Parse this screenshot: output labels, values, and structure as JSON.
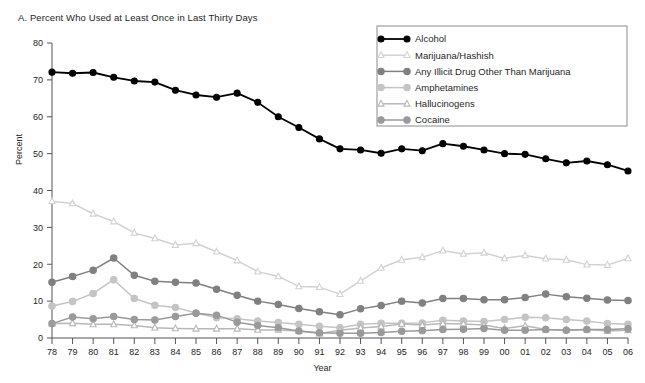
{
  "panel": {
    "title": "A. Percent Who Used at Least Once in Last Thirty Days"
  },
  "axes": {
    "ylabel": "Percent",
    "xlabel": "Year",
    "ytick_labels": [
      "0",
      "10",
      "20",
      "30",
      "40",
      "50",
      "60",
      "70",
      "80"
    ],
    "xtick_labels": [
      "78",
      "79",
      "80",
      "81",
      "82",
      "83",
      "84",
      "85",
      "86",
      "87",
      "88",
      "89",
      "90",
      "91",
      "92",
      "93",
      "94",
      "95",
      "96",
      "97",
      "98",
      "99",
      "00",
      "01",
      "02",
      "03",
      "04",
      "05",
      "06"
    ]
  },
  "legend": {
    "entries": [
      {
        "label": "Alcohol",
        "color": "#000000",
        "marker": "circle",
        "filled": true
      },
      {
        "label": "Marijuana/Hashish",
        "color": "#d2d2d2",
        "marker": "triangle",
        "filled": false
      },
      {
        "label": "Any Illicit Drug Other Than Marijuana",
        "color": "#808080",
        "marker": "circle",
        "filled": true
      },
      {
        "label": "Amphetamines",
        "color": "#c4c4c4",
        "marker": "circle",
        "filled": true
      },
      {
        "label": "Hallucinogens",
        "color": "#b8b8b8",
        "marker": "triangle",
        "filled": false
      },
      {
        "label": "Cocaine",
        "color": "#9a9a9a",
        "marker": "circle",
        "filled": true
      }
    ]
  },
  "chart_data": {
    "type": "line",
    "title": "A. Percent Who Used at Least Once in Last Thirty Days",
    "xlabel": "Year",
    "ylabel": "Percent",
    "xlim": [
      0,
      28
    ],
    "ylim": [
      0,
      80
    ],
    "ytick_step": 10,
    "grid": false,
    "legend_position": "top-right",
    "categories": [
      "78",
      "79",
      "80",
      "81",
      "82",
      "83",
      "84",
      "85",
      "86",
      "87",
      "88",
      "89",
      "90",
      "91",
      "92",
      "93",
      "94",
      "95",
      "96",
      "97",
      "98",
      "99",
      "00",
      "01",
      "02",
      "03",
      "04",
      "05",
      "06"
    ],
    "series": [
      {
        "name": "Alcohol",
        "color": "#000000",
        "marker": "circle",
        "filled": true,
        "values": [
          72.1,
          71.8,
          72.0,
          70.7,
          69.7,
          69.4,
          67.2,
          65.9,
          65.3,
          66.4,
          63.9,
          60.0,
          57.1,
          54.0,
          51.3,
          51.0,
          50.1,
          51.3,
          50.8,
          52.7,
          52.0,
          51.0,
          50.0,
          49.8,
          48.6,
          47.5,
          48.0,
          47.0,
          45.3
        ],
        "values_approx": true
      },
      {
        "name": "Marijuana/Hashish",
        "color": "#d2d2d2",
        "marker": "triangle",
        "filled": false,
        "values": [
          37.1,
          36.5,
          33.7,
          31.6,
          28.5,
          27.0,
          25.2,
          25.7,
          23.4,
          21.0,
          18.0,
          16.7,
          14.0,
          13.8,
          11.9,
          15.5,
          19.0,
          21.2,
          21.9,
          23.7,
          22.8,
          23.1,
          21.6,
          22.4,
          21.5,
          21.2,
          19.9,
          19.8,
          21.6
        ],
        "values_approx": true
      },
      {
        "name": "Any Illicit Drug Other Than Marijuana",
        "color": "#808080",
        "marker": "circle",
        "filled": true,
        "values": [
          15.1,
          16.7,
          18.4,
          21.7,
          17.0,
          15.4,
          15.1,
          14.9,
          13.2,
          11.6,
          10.0,
          9.1,
          8.0,
          7.1,
          6.3,
          7.9,
          8.8,
          10.0,
          9.5,
          10.7,
          10.7,
          10.4,
          10.4,
          11.0,
          11.9,
          11.2,
          10.8,
          10.3,
          10.2
        ],
        "values_approx": true
      },
      {
        "name": "Amphetamines",
        "color": "#c4c4c4",
        "marker": "circle",
        "filled": true,
        "values": [
          8.7,
          9.9,
          12.1,
          15.8,
          10.7,
          8.9,
          8.3,
          6.8,
          5.5,
          5.2,
          4.6,
          4.2,
          3.7,
          3.2,
          2.8,
          3.7,
          4.0,
          4.0,
          4.1,
          4.8,
          4.6,
          4.5,
          5.0,
          5.6,
          5.5,
          5.0,
          4.6,
          3.9,
          3.7
        ],
        "values_approx": true
      },
      {
        "name": "Hallucinogens",
        "color": "#b8b8b8",
        "marker": "triangle",
        "filled": false,
        "values": [
          3.9,
          4.0,
          3.7,
          3.7,
          3.4,
          2.8,
          2.6,
          2.5,
          2.5,
          2.5,
          2.2,
          2.2,
          1.9,
          1.2,
          2.1,
          2.7,
          3.1,
          3.8,
          3.5,
          3.9,
          3.8,
          3.5,
          2.6,
          3.3,
          2.3,
          2.2,
          2.3,
          1.9,
          2.1
        ],
        "values_approx": true
      },
      {
        "name": "Cocaine",
        "color": "#9a9a9a",
        "marker": "circle",
        "filled": true,
        "values": [
          3.9,
          5.7,
          5.2,
          5.8,
          5.0,
          4.9,
          5.8,
          6.7,
          6.2,
          4.3,
          3.4,
          2.8,
          1.9,
          1.4,
          1.3,
          1.3,
          1.5,
          1.8,
          2.0,
          2.3,
          2.4,
          2.6,
          2.1,
          2.1,
          2.3,
          2.1,
          2.3,
          2.3,
          2.5
        ],
        "values_approx": true
      }
    ]
  }
}
